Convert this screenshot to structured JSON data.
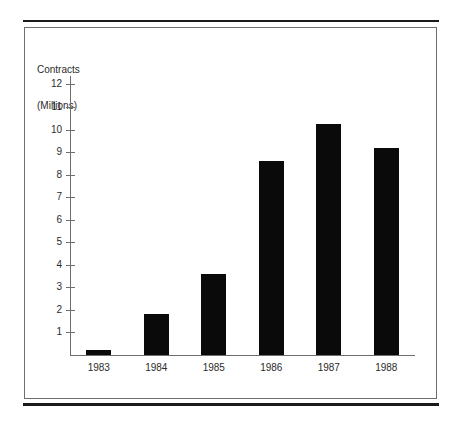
{
  "figure": {
    "axis_title_line1": "Contracts",
    "axis_title_line2": "(Millions)"
  },
  "chart_data": {
    "type": "bar",
    "title": "Contracts (Millions)",
    "xlabel": "",
    "ylabel": "Contracts (Millions)",
    "categories": [
      "1983",
      "1984",
      "1985",
      "1986",
      "1987",
      "1988"
    ],
    "values": [
      0.2,
      1.8,
      3.6,
      8.6,
      10.25,
      9.2
    ],
    "ytick_labels": [
      "12",
      "11",
      "10",
      "9",
      "8",
      "7",
      "6",
      "5",
      "4",
      "3",
      "2",
      "1"
    ],
    "ytick_values": [
      12,
      11,
      10,
      9,
      8,
      7,
      6,
      5,
      4,
      3,
      2,
      1
    ],
    "ylim": [
      0,
      12.4
    ],
    "grid": false,
    "legend": false,
    "bar_color": "#0a0a0a",
    "axis_color": "#6e6e6e"
  }
}
